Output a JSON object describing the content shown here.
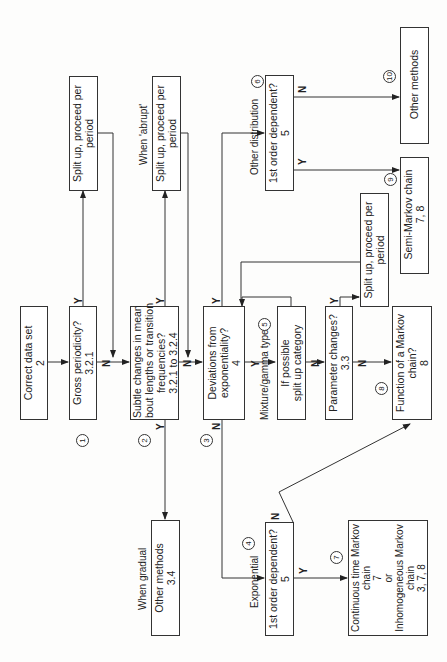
{
  "diagram": {
    "orientation": "rotated 90 degrees counter-clockwise",
    "nodes": {
      "correct_data": {
        "line1": "Correct data set",
        "line2": "2"
      },
      "gross": {
        "line1": "Gross periodicity?",
        "line2": "3.2.1"
      },
      "subtle": {
        "line1": "Subtle changes in mean",
        "line2": "bout lengths or transition",
        "line3": "frequencies?",
        "line4": "3.2.1 to 3.2.4"
      },
      "deviations": {
        "line1": "Deviations from",
        "line2": "exponentiality?",
        "line3": "4"
      },
      "split1": {
        "line1": "Split up, proceed per",
        "line2": "period"
      },
      "split2": {
        "line1": "Split up, proceed per",
        "line2": "period"
      },
      "split3": {
        "line1": "Split up, proceed per",
        "line2": "period"
      },
      "first_order_other": {
        "line1": "1st order dependent?",
        "line2": "5"
      },
      "other_methods_10": {
        "line1": "Other methods"
      },
      "semi_markov": {
        "line1": "Semi-Markov chain",
        "line2": "7, 8"
      },
      "if_possible": {
        "line1": "If possible",
        "line2": "split up category"
      },
      "parameter": {
        "line1": "Parameter changes?",
        "line2": "3.3"
      },
      "function_markov": {
        "line1": "Function of a Markov",
        "line2": "chain?",
        "line3": "8"
      },
      "other_methods_34": {
        "line1": "Other methods",
        "line2": "3.4"
      },
      "first_order_exp": {
        "line1": "1st order dependent?",
        "line2": "5"
      },
      "continuous": {
        "line1": "Continuous time Markov",
        "line2": "chain",
        "line3": "7",
        "line4": "or",
        "line5": "Inhomogeneous Markov",
        "line6": "chain",
        "line7": "3, 7, 8"
      }
    },
    "labels": {
      "abrupt": "When 'abrupt'",
      "gradual": "When gradual",
      "other_distribution": "Other distribution",
      "mixture": "Mixture/gamma type",
      "exponential": "Exponential"
    },
    "branch": {
      "yes": "Y",
      "no": "N"
    },
    "circled_numbers": [
      "1",
      "2",
      "3",
      "4",
      "5",
      "6",
      "7",
      "8",
      "9",
      "10"
    ]
  }
}
